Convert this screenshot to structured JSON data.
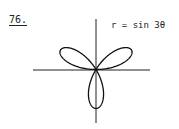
{
  "problem": {
    "number": "76.",
    "equation": "r = sin 3θ"
  },
  "chart_data": {
    "type": "line",
    "subtype": "polar",
    "title": "r = sin 3θ",
    "equation": "r = sin(3θ)",
    "theta_range": [
      0,
      3.14159
    ],
    "curve": "three-petal rose",
    "petals": [
      {
        "direction_deg": 30,
        "max_r": 1
      },
      {
        "direction_deg": 150,
        "max_r": 1
      },
      {
        "direction_deg": 270,
        "max_r": 1
      }
    ],
    "axes": {
      "x": true,
      "y": true,
      "ticks": false,
      "labels": false
    },
    "grid": false,
    "legend": null
  }
}
